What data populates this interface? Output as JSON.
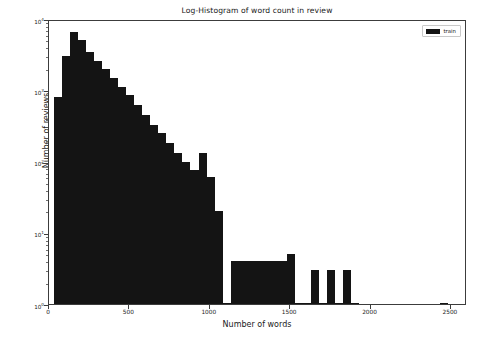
{
  "chart_data": {
    "type": "bar",
    "title": "Log-Histogram of word count in review",
    "xlabel": "Number of words",
    "ylabel": "Number of reviews",
    "yscale": "log",
    "xlim": [
      0,
      2600
    ],
    "ylim": [
      1,
      10000
    ],
    "grid": false,
    "legend": {
      "position": "upper right",
      "entries": [
        {
          "label": "train",
          "color": "#141414"
        }
      ]
    },
    "xticks": [
      0,
      500,
      1000,
      1500,
      2000,
      2500
    ],
    "xtick_labels": [
      "0",
      "500",
      "1000",
      "1500",
      "2000",
      "2500"
    ],
    "yticks": [
      1,
      10,
      100,
      1000,
      10000
    ],
    "ytick_labels": [
      "10⁰",
      "10¹",
      "10²",
      "10³",
      "10⁴"
    ],
    "ytick_mantissa": [
      "10",
      "10",
      "10",
      "10",
      "10"
    ],
    "ytick_exponent": [
      "0",
      "1",
      "2",
      "3",
      "4"
    ],
    "bin_width": 50,
    "series": [
      {
        "name": "train",
        "color": "#141414",
        "bin_starts": [
          30,
          80,
          130,
          180,
          230,
          280,
          330,
          380,
          430,
          480,
          530,
          580,
          630,
          680,
          730,
          780,
          830,
          880,
          930,
          980,
          1030,
          1080,
          1130,
          1180,
          1230,
          1280,
          1330,
          1380,
          1430,
          1480,
          1530,
          1580,
          1630,
          1680,
          1730,
          1780,
          1830,
          1880,
          2430
        ],
        "values": [
          800,
          3000,
          6500,
          5000,
          3500,
          2600,
          2000,
          1500,
          1100,
          850,
          620,
          450,
          330,
          250,
          180,
          130,
          100,
          75,
          130,
          60,
          20,
          1,
          4,
          4,
          4,
          4,
          4,
          4,
          4,
          5,
          1,
          1,
          3,
          1,
          3,
          1,
          3,
          1,
          1
        ]
      }
    ]
  }
}
